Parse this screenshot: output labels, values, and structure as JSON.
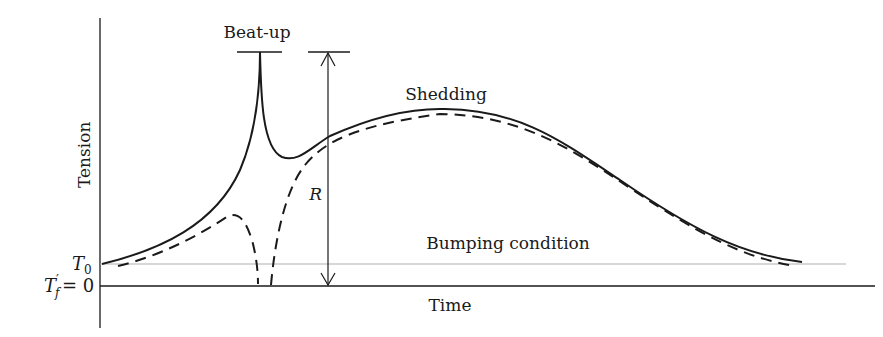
{
  "diagram": {
    "y_axis_label": "Tension",
    "x_axis_label": "Time",
    "t0_label": "T",
    "t0_sub": "0",
    "tf_label": "T",
    "tf_prime": "′",
    "tf_sub": "f",
    "tf_eq": "= 0",
    "beatup_label": "Beat-up",
    "r_label": "R",
    "shedding_label": "Shedding",
    "bumping_label": "Bumping condition",
    "colors": {
      "line": "#1a1a1a",
      "reference_line": "#b0b0b0"
    },
    "curves": [
      {
        "name": "warp-tension-solid",
        "style": "solid"
      },
      {
        "name": "warp-tension-dashed",
        "style": "dashed"
      }
    ]
  }
}
